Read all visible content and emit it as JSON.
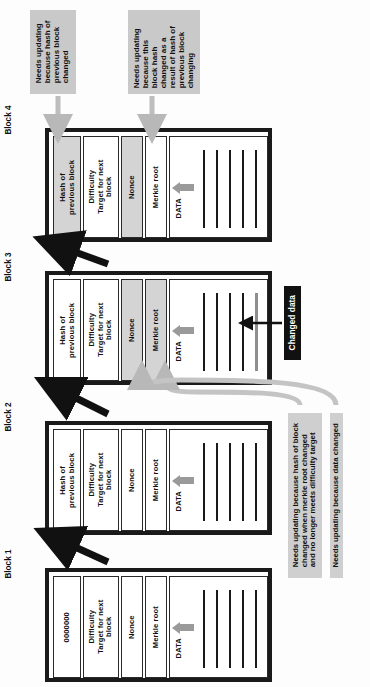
{
  "diagram": {
    "orientation": "rotated-90",
    "colors": {
      "shaded_cell": "#d4d4d4",
      "callout_bg": "#c9c9c9",
      "callout_dark_bg": "#111111",
      "changed_data_line": "#8e8e8e",
      "black_arrow": "#111111",
      "gray_arrow": "#b8b8b8",
      "merkle_arrow": "#9a9a9a"
    }
  },
  "blocks": [
    {
      "caption": "Block 1",
      "fields": {
        "prev_hash": "0000000",
        "difficulty": "Difficulty\nTarget for next\nblock",
        "nonce": "Nonce",
        "merkle": "Merkle root",
        "data_caption": "DATA"
      },
      "shaded": [],
      "data_lines": 5,
      "changed_line_index": -1
    },
    {
      "caption": "Block 2",
      "fields": {
        "prev_hash": "Hash of\nprevious block",
        "difficulty": "Difficulty\nTarget for next\nblock",
        "nonce": "Nonce",
        "merkle": "Merkle root",
        "data_caption": "DATA"
      },
      "shaded": [],
      "data_lines": 5,
      "changed_line_index": -1
    },
    {
      "caption": "Block 3",
      "fields": {
        "prev_hash": "Hash of\nprevious block",
        "difficulty": "Difficulty\nTarget for next\nblock",
        "nonce": "Nonce",
        "merkle": "Merkle root",
        "data_caption": "DATA"
      },
      "shaded": [
        "nonce",
        "merkle"
      ],
      "data_lines": 5,
      "changed_line_index": 4
    },
    {
      "caption": "Block 4",
      "fields": {
        "prev_hash": "Hash of\nprevious block",
        "difficulty": "Difficulty\nTarget for next\nblock",
        "nonce": "Nonce",
        "merkle": "Merkle root",
        "data_caption": "DATA"
      },
      "shaded": [
        "prev_hash",
        "nonce"
      ],
      "data_lines": 5,
      "changed_line_index": -1
    }
  ],
  "callouts": {
    "hash_prev_changed": "Needs updating\nbecause hash of\nprevious block\nchanged",
    "block_hash_changed": "Needs updating\nbecause this\nblock hash\nchanged as a\nresult of hash of\nprevious block\nchanging",
    "changed_data": "Changed data",
    "merkle_difficulty": "Needs updating because hash of block\nchanged when merkle root changed\nand no longer meets difficulty target",
    "data_changed": "Needs updating because data changed"
  }
}
